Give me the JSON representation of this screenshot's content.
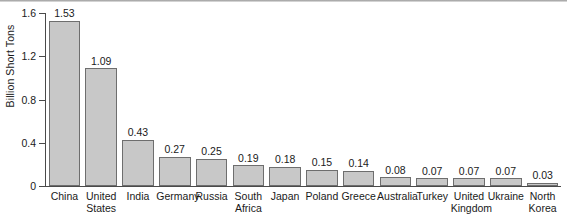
{
  "chart_data": {
    "type": "bar",
    "title": "",
    "xlabel": "",
    "ylabel": "Billion Short Tons",
    "ylim": [
      0,
      1.6
    ],
    "yticks": [
      "0",
      "0.4",
      "0.8",
      "1.2",
      "1.6"
    ],
    "ytick_values": [
      0,
      0.4,
      0.8,
      1.2,
      1.6
    ],
    "grid": false,
    "legend": null,
    "bar_fill_color": "#c8c8c8",
    "bar_edge_color": "#6e6e6e",
    "axis_color": "#4a4a4a",
    "background_color": "#ffffff",
    "value_label_format": "2dp",
    "categories": [
      "China",
      "United States",
      "India",
      "Germany",
      "Russia",
      "South Africa",
      "Japan",
      "Poland",
      "Greece",
      "Australia",
      "Turkey",
      "United Kingdom",
      "Ukraine",
      "North Korea"
    ],
    "values": [
      1.53,
      1.09,
      0.43,
      0.27,
      0.25,
      0.19,
      0.18,
      0.15,
      0.14,
      0.08,
      0.07,
      0.07,
      0.07,
      0.03
    ],
    "value_labels": [
      "1.53",
      "1.09",
      "0.43",
      "0.27",
      "0.25",
      "0.19",
      "0.18",
      "0.15",
      "0.14",
      "0.08",
      "0.07",
      "0.07",
      "0.07",
      "0.03"
    ],
    "category_lines": [
      [
        "China"
      ],
      [
        "United",
        "States"
      ],
      [
        "India"
      ],
      [
        "Germany"
      ],
      [
        "Russia"
      ],
      [
        "South",
        "Africa"
      ],
      [
        "Japan"
      ],
      [
        "Poland"
      ],
      [
        "Greece"
      ],
      [
        "Australia"
      ],
      [
        "Turkey"
      ],
      [
        "United",
        "Kingdom"
      ],
      [
        "Ukraine"
      ],
      [
        "North",
        "Korea"
      ]
    ]
  }
}
